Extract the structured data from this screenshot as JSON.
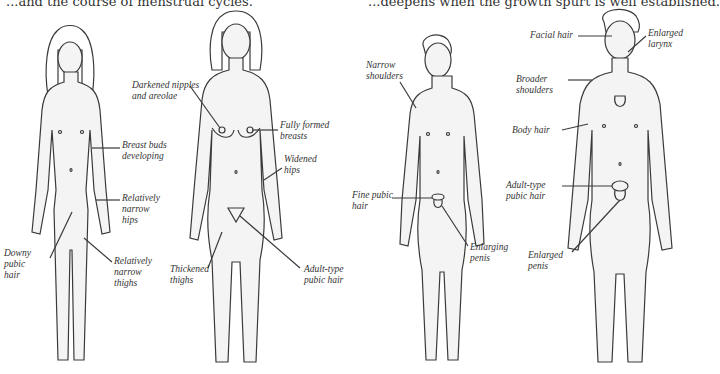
{
  "captions": {
    "left": "...and the course of menstrual cycles.",
    "right": "...deepens when the growth spurt is well established."
  },
  "figures": [
    {
      "id": "girl-early-puberty",
      "labels": [
        "Breast buds\ndeveloping",
        "Relatively\nnarrow\nhips",
        "Downy\npubic\nhair",
        "Relatively\nnarrow\nthighs"
      ]
    },
    {
      "id": "woman-adult",
      "labels": [
        "Darkened nipples\nand areolae",
        "Fully formed\nbreasts",
        "Widened\nhips",
        "Thickened\nthighs",
        "Adult-type\npubic hair"
      ]
    },
    {
      "id": "boy-early-puberty",
      "labels": [
        "Narrow\nshoulders",
        "Fine pubic\nhair",
        "Enlarging\npenis"
      ]
    },
    {
      "id": "man-adult",
      "labels": [
        "Facial hair",
        "Enlarged\nlarynx",
        "Broader\nshoulders",
        "Body hair",
        "Adult-type\npubic hair",
        "Enlarged\npenis"
      ]
    }
  ]
}
